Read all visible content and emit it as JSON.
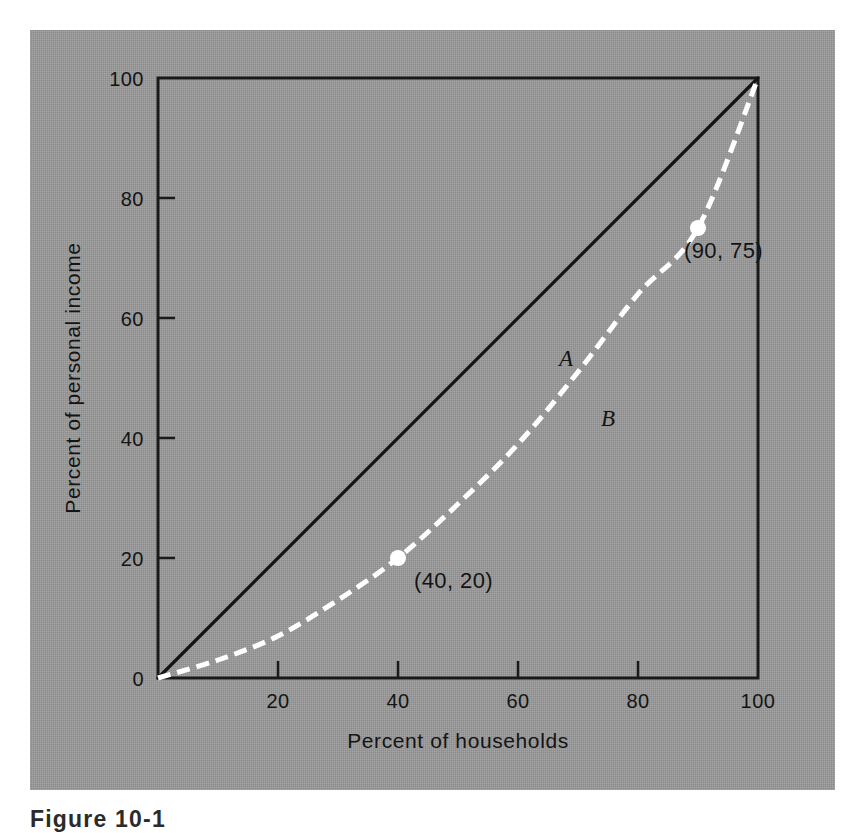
{
  "figure": {
    "caption": "Figure 10-1",
    "background_color": "#9a9a9a",
    "page_color": "#ffffff"
  },
  "chart_data": {
    "type": "line",
    "title": "",
    "xlabel": "Percent of households",
    "ylabel": "Percent of personal income",
    "xlim": [
      0,
      100
    ],
    "ylim": [
      0,
      100
    ],
    "grid": false,
    "legend_position": "inline-labels",
    "xticks": [
      "0",
      "20",
      "40",
      "60",
      "80",
      "100"
    ],
    "xtick_values": [
      0,
      20,
      40,
      60,
      80,
      100
    ],
    "yticks": [
      "0",
      "20",
      "40",
      "60",
      "80",
      "100"
    ],
    "ytick_values": [
      0,
      20,
      40,
      60,
      80,
      100
    ],
    "series": [
      {
        "name": "A",
        "label": "A",
        "style": "solid",
        "color": "#141414",
        "x": [
          0,
          100
        ],
        "values": [
          0,
          100
        ],
        "label_x": 68,
        "label_y": 52
      },
      {
        "name": "B",
        "label": "B",
        "style": "dashed",
        "color": "#ffffff",
        "x": [
          0,
          10,
          20,
          30,
          40,
          50,
          60,
          70,
          80,
          90,
          100
        ],
        "values": [
          0,
          3,
          7,
          13,
          20,
          29,
          39,
          51,
          64,
          75,
          100
        ],
        "label_x": 75,
        "label_y": 42
      }
    ],
    "annotations": [
      {
        "text": "(40, 20)",
        "x": 40,
        "y": 20,
        "marker": true
      },
      {
        "text": "(90, 75)",
        "x": 90,
        "y": 75,
        "marker": true
      }
    ]
  }
}
